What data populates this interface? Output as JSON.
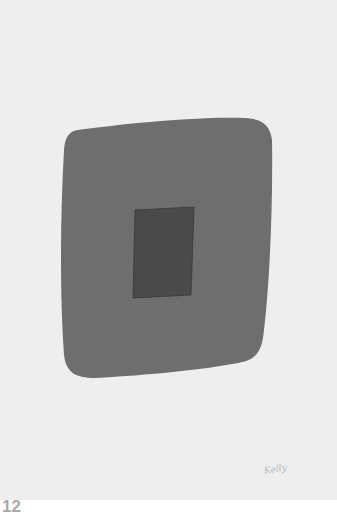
{
  "artwork": {
    "plate_number": "12",
    "signature": "Kelly",
    "colors": {
      "paper": "#eeeeee",
      "outer_shape": "#6e6e6e",
      "inner_rect": "#4a4a4a",
      "label": "#a9a9a9"
    }
  }
}
